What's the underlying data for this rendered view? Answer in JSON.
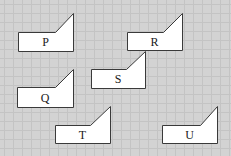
{
  "figure": {
    "background_color": "#d3d3d3",
    "grid_color": "#c4c4c4",
    "shape_fill": "#ffffff",
    "shape_stroke": "#3a3a3a",
    "shapes": [
      {
        "id": "P",
        "label": "P"
      },
      {
        "id": "R",
        "label": "R"
      },
      {
        "id": "Q",
        "label": "Q"
      },
      {
        "id": "S",
        "label": "S"
      },
      {
        "id": "T",
        "label": "T"
      },
      {
        "id": "U",
        "label": "U"
      }
    ]
  }
}
